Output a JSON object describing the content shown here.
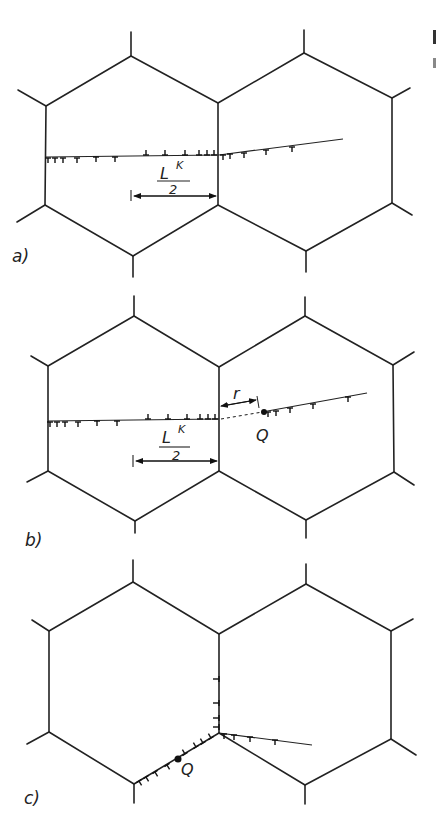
{
  "figure": {
    "panels": [
      {
        "id": "a",
        "label": "a)",
        "length_label_main": "L",
        "length_label_sup": "K",
        "length_label_denominator": "2"
      },
      {
        "id": "b",
        "label": "b)",
        "length_label_main": "L",
        "length_label_sup": "K",
        "length_label_denominator": "2",
        "distance_label": "r",
        "source_label": "Q"
      },
      {
        "id": "c",
        "label": "c)",
        "source_label": "Q"
      }
    ],
    "colors": {
      "line": "#222222",
      "background": "#ffffff"
    }
  }
}
